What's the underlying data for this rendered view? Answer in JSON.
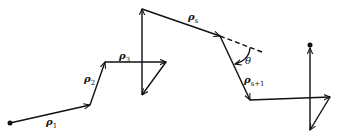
{
  "diagram": {
    "colors": {
      "stroke": "#111111",
      "background": "#ffffff"
    },
    "labels": {
      "rho1": {
        "base": "ρ",
        "sub": "1"
      },
      "rho2": {
        "base": "ρ",
        "sub": "2"
      },
      "rho3": {
        "base": "ρ",
        "sub": "3"
      },
      "rhos": {
        "base": "ρ",
        "sub": "s"
      },
      "rhos1": {
        "base": "ρ",
        "sub": "s+1"
      },
      "theta": "θ"
    },
    "points": [
      [
        10,
        123
      ],
      [
        90,
        105
      ],
      [
        105,
        62
      ],
      [
        166,
        62
      ],
      [
        142,
        95
      ],
      [
        142,
        9
      ],
      [
        220,
        36
      ],
      [
        250,
        100
      ],
      [
        330,
        97
      ],
      [
        310,
        130
      ],
      [
        310,
        45
      ]
    ]
  }
}
